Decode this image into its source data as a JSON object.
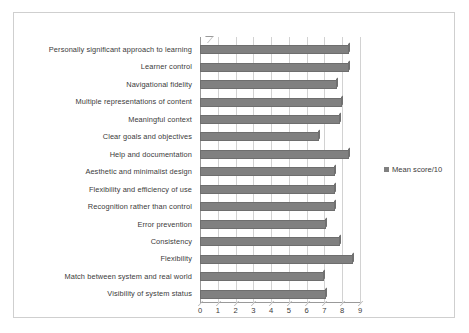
{
  "chart_data": {
    "type": "bar",
    "orientation": "horizontal",
    "title": "",
    "subtitle": "",
    "xlabel": "",
    "ylabel": "",
    "xlim": [
      0,
      9
    ],
    "xticks": [
      0,
      1,
      2,
      3,
      4,
      5,
      6,
      7,
      8,
      9
    ],
    "xtick_labels": [
      "0",
      "1",
      "2",
      "3",
      "4",
      "5",
      "6",
      "7",
      "8",
      "9"
    ],
    "grid": true,
    "grid_axis": "x",
    "legend_position": "right",
    "legend": [
      "Mean score/10"
    ],
    "bar_color": "#808080",
    "bar_edge_color": "#6e6e6e",
    "categories": [
      "Personally significant approach to learning",
      "Learner control",
      "Navigational fidelity",
      "Multiple representations of content",
      "Meaningful context",
      "Clear goals and objectives",
      "Help and documentation",
      "Aesthetic and minimalist design",
      "Flexibility and efficiency of use",
      "Recognition rather than control",
      "Error prevention",
      "Consistency",
      "Flexibility",
      "Match between system and real world",
      "Visibility of system status"
    ],
    "series": [
      {
        "name": "Mean score/10",
        "values": [
          8.4,
          8.4,
          7.7,
          8.0,
          7.9,
          6.7,
          8.4,
          7.6,
          7.6,
          7.6,
          7.1,
          7.9,
          8.6,
          7.0,
          7.1
        ]
      }
    ]
  },
  "legend": {
    "label": "Mean score/10",
    "swatch_color": "#808080"
  },
  "axis": {
    "x_tick_labels": [
      "0",
      "1",
      "2",
      "3",
      "4",
      "5",
      "6",
      "7",
      "8",
      "9"
    ]
  }
}
